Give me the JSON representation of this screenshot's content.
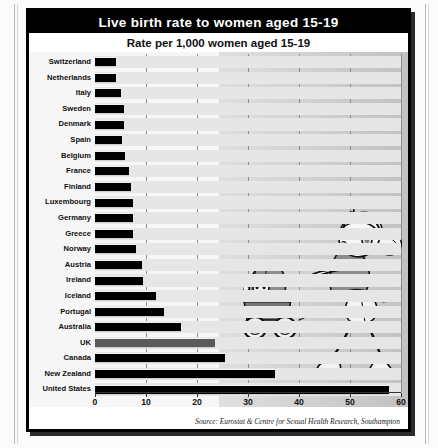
{
  "graphic": {
    "title": "Live birth rate to women aged 15-19",
    "subtitle": "Rate per 1,000 women aged 15-19",
    "source": "Source: Eurostat & Centre for Sexual Health Research, Southampton",
    "colors": {
      "title_bg": "#000000",
      "title_fg": "#ffffff",
      "bar": "#000000",
      "bar_highlight": "#5a5a5a",
      "plot_bg": "#f6f6f6",
      "frame": "#000000"
    },
    "illustration": {
      "name": "teenage-mother-pushing-pram",
      "elements": [
        "pram",
        "baby",
        "teenage-girl",
        "headphones",
        "music-notes",
        "ponytail",
        "trainers"
      ]
    }
  },
  "chart_data": {
    "type": "bar",
    "orientation": "horizontal",
    "title": "Live birth rate to women aged 15-19",
    "subtitle": "Rate per 1,000 women aged 15-19",
    "xlabel": "",
    "ylabel": "",
    "xlim": [
      0,
      60
    ],
    "xticks": [
      0,
      10,
      20,
      30,
      40,
      50,
      60
    ],
    "grid": true,
    "legend": false,
    "highlight": "UK",
    "categories": [
      "Switzerland",
      "Netherlands",
      "Italy",
      "Sweden",
      "Denmark",
      "Spain",
      "Belgium",
      "France",
      "Finland",
      "Luxembourg",
      "Germany",
      "Greece",
      "Norway",
      "Austria",
      "Ireland",
      "Iceland",
      "Portugal",
      "Australia",
      "UK",
      "Canada",
      "New Zealand",
      "United States"
    ],
    "values": [
      4.1,
      4.1,
      5.1,
      5.6,
      5.7,
      5.2,
      5.9,
      6.6,
      7.1,
      7.5,
      7.5,
      7.5,
      8.1,
      9.3,
      9.5,
      11.9,
      13.6,
      16.8,
      23.6,
      25.5,
      35.3,
      57.6
    ]
  }
}
